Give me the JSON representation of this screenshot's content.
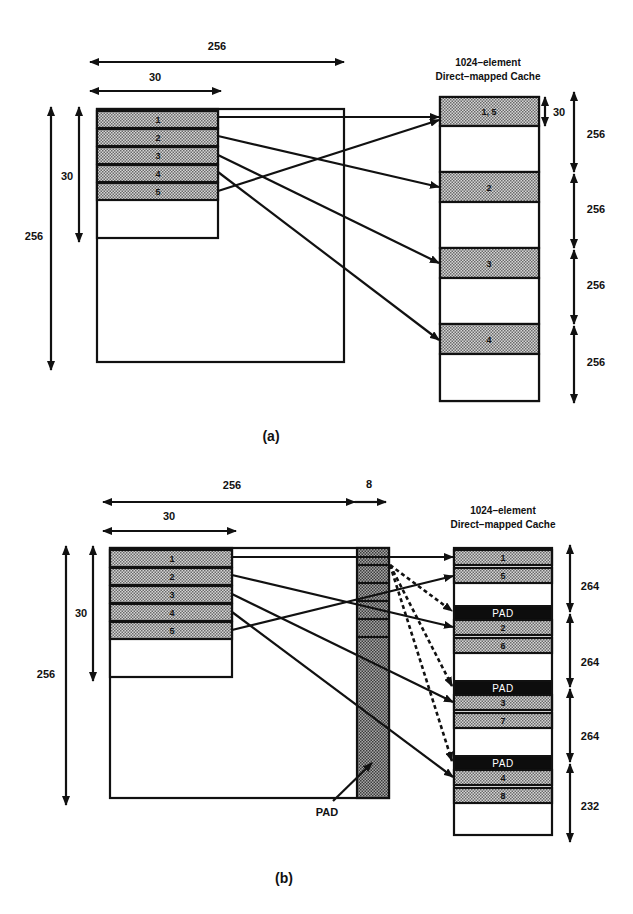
{
  "figure_a": {
    "caption": "(a)",
    "array_width_label": "256",
    "block_width_label": "30",
    "array_height_label": "256",
    "block_height_label": "30",
    "array_rows": [
      "1",
      "2",
      "3",
      "4",
      "5"
    ],
    "cache_title_line1": "1024–element",
    "cache_title_line2": "Direct–mapped Cache",
    "cache_slots": [
      {
        "label": "1, 5",
        "filled": true
      },
      {
        "label": "",
        "filled": false
      },
      {
        "label": "2",
        "filled": true
      },
      {
        "label": "",
        "filled": false
      },
      {
        "label": "3",
        "filled": true
      },
      {
        "label": "",
        "filled": false
      },
      {
        "label": "4",
        "filled": true
      },
      {
        "label": "",
        "filled": false
      }
    ],
    "cache_row_height_label": "30",
    "cache_segment_labels": [
      "256",
      "256",
      "256",
      "256"
    ]
  },
  "figure_b": {
    "caption": "(b)",
    "array_width_label": "256",
    "pad_width_label": "8",
    "block_width_label": "30",
    "array_height_label": "256",
    "block_height_label": "30",
    "array_rows": [
      "1",
      "2",
      "3",
      "4",
      "5"
    ],
    "pad_column_label": "PAD",
    "cache_title_line1": "1024–element",
    "cache_title_line2": "Direct–mapped Cache",
    "cache_slots": [
      {
        "label": "1",
        "type": "filled"
      },
      {
        "label": "5",
        "type": "filled"
      },
      {
        "label": "",
        "type": "empty"
      },
      {
        "label": "PAD",
        "type": "pad"
      },
      {
        "label": "2",
        "type": "filled"
      },
      {
        "label": "6",
        "type": "filled"
      },
      {
        "label": "",
        "type": "empty"
      },
      {
        "label": "PAD",
        "type": "pad"
      },
      {
        "label": "3",
        "type": "filled"
      },
      {
        "label": "7",
        "type": "filled"
      },
      {
        "label": "",
        "type": "empty"
      },
      {
        "label": "PAD",
        "type": "pad"
      },
      {
        "label": "4",
        "type": "filled"
      },
      {
        "label": "8",
        "type": "filled"
      },
      {
        "label": "",
        "type": "empty"
      }
    ],
    "cache_segment_labels": [
      "264",
      "264",
      "264",
      "232"
    ]
  }
}
